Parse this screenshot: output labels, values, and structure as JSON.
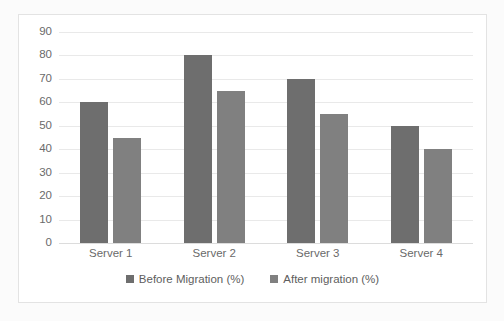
{
  "chart_data": {
    "type": "bar",
    "title": "",
    "subtitle": "",
    "xlabel": "",
    "ylabel": "",
    "categories": [
      "Server 1",
      "Server 2",
      "Server 3",
      "Server 4"
    ],
    "series": [
      {
        "name": "Before Migration (%)",
        "color": "#6e6e6e",
        "values": [
          60,
          80,
          70,
          50
        ]
      },
      {
        "name": "After migration (%)",
        "color": "#808080",
        "values": [
          45,
          65,
          55,
          40
        ]
      }
    ],
    "ylim": [
      0,
      90
    ],
    "ytick_step": 10,
    "yticks": [
      0,
      10,
      20,
      30,
      40,
      50,
      60,
      70,
      80,
      90
    ],
    "ytick_labels": [
      "0",
      "10",
      "20",
      "30",
      "40",
      "50",
      "60",
      "70",
      "80",
      "90"
    ],
    "grid": true,
    "grid_axis": "y",
    "grid_color": "#e9e9e9",
    "legend": true,
    "legend_position": "bottom",
    "plot_background": "#ffffff",
    "frame_border_color": "#e3e3e3"
  }
}
